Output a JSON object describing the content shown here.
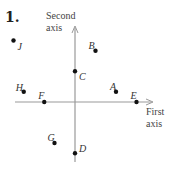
{
  "problem_number": "1.",
  "axes": {
    "x_label_line1": "First",
    "x_label_line2": "axis",
    "y_label_line1": "Second",
    "y_label_line2": "axis",
    "axis_color": "#999999",
    "point_color": "#111111"
  },
  "points": [
    {
      "label": "A",
      "x": 2,
      "y": 0.5
    },
    {
      "label": "B",
      "x": 1,
      "y": 2.5
    },
    {
      "label": "C",
      "x": 0,
      "y": 1.5
    },
    {
      "label": "D",
      "x": 0,
      "y": -2.5
    },
    {
      "label": "E",
      "x": 3,
      "y": 0
    },
    {
      "label": "F",
      "x": -1.5,
      "y": 0
    },
    {
      "label": "G",
      "x": -1,
      "y": -2
    },
    {
      "label": "H",
      "x": -2.5,
      "y": 0.5
    },
    {
      "label": "J",
      "x": -3,
      "y": 3
    }
  ]
}
